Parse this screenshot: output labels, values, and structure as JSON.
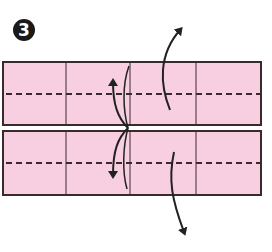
{
  "step": {
    "number": "3"
  },
  "diagram": {
    "paper_color": "#f7cfe0",
    "line_color": "#3a2a2e",
    "dashed_line_color": "#3a2a2e",
    "arrow_color": "#222222",
    "background": "#ffffff",
    "sheet": {
      "x": 2,
      "y": 61,
      "width": 260,
      "height": 135
    },
    "panels": [
      {
        "name": "top-panel",
        "y": 61,
        "height": 64
      },
      {
        "name": "bottom-panel",
        "y": 131,
        "height": 65
      }
    ],
    "column_dividers_x": [
      66,
      130,
      196
    ],
    "valley_fold_lines_y": [
      94,
      163
    ],
    "arrows": [
      {
        "name": "fold-up-arrow-right",
        "direction": "up"
      },
      {
        "name": "fold-down-arrow-right",
        "direction": "down"
      },
      {
        "name": "fold-up-arrow-center",
        "direction": "up"
      },
      {
        "name": "fold-down-arrow-center",
        "direction": "down"
      }
    ]
  }
}
